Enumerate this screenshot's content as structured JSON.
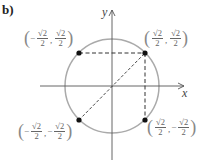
{
  "figure": {
    "part_label": "b)",
    "axes": {
      "x_label": "x",
      "y_label": "y"
    },
    "circle": {
      "type": "unit circle",
      "stroke_color": "#aaaaaa"
    },
    "points": [
      {
        "name": "upper-right",
        "sign_x": "",
        "num_x": "√2",
        "den_x": "2",
        "sign_y": "",
        "num_y": "√2",
        "den_y": "2"
      },
      {
        "name": "upper-left",
        "sign_x": "−",
        "num_x": "√2",
        "den_x": "2",
        "sign_y": "",
        "num_y": "√2",
        "den_y": "2"
      },
      {
        "name": "lower-left",
        "sign_x": "−",
        "num_x": "√2",
        "den_x": "2",
        "sign_y": "−",
        "num_y": "√2",
        "den_y": "2"
      },
      {
        "name": "lower-right",
        "sign_x": "",
        "num_x": "√2",
        "den_x": "2",
        "sign_y": "−",
        "num_y": "√2",
        "den_y": "2"
      }
    ],
    "point_color": "#111111",
    "dashed_color": "#333333"
  }
}
